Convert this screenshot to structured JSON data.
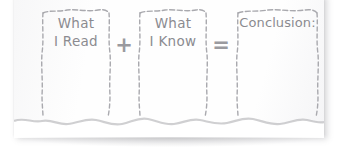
{
  "worksheet": {
    "title": "Conclusion graphic organizer",
    "equation_reading": "What I Read + What I Know = Conclusion:",
    "paper_color": "#fdfdfd",
    "ink_color": "#8b8b90",
    "border_color": "#a6a6ab",
    "boxes": [
      {
        "id": "what-i-read",
        "text": "What\nI Read",
        "line1": "What",
        "line2": "I Read"
      },
      {
        "id": "what-i-know",
        "text": "What\nI Know",
        "line1": "What",
        "line2": "I Know"
      },
      {
        "id": "conclusion",
        "text": "Conclusion:",
        "line1": "Conclusion:",
        "line2": ""
      }
    ],
    "operators": [
      {
        "id": "plus",
        "symbol": "+",
        "name": "plus-sign"
      },
      {
        "id": "equals",
        "symbol": "=",
        "name": "equals-sign"
      }
    ]
  }
}
